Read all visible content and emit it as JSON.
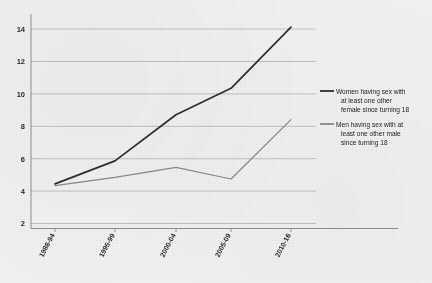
{
  "chart_data": {
    "type": "line",
    "title": "",
    "subtitle": "",
    "xlabel": "",
    "ylabel": "",
    "categories": [
      "1988-94",
      "1995-99",
      "2000-04",
      "2005-09",
      "2010-16"
    ],
    "series": [
      {
        "name": "Women having sex with at least one other female since turning 18",
        "short_name": "women",
        "values": [
          4.7,
          6.1,
          8.9,
          10.5,
          14.2
        ],
        "color": "#2e2e2e"
      },
      {
        "name": "Men having sex with at least one other male since turning 18",
        "short_name": "men",
        "values": [
          4.6,
          5.1,
          5.7,
          5.0,
          8.6
        ],
        "color": "#8a8a8a"
      }
    ],
    "ylim": [
      2,
      15
    ],
    "yticks": [
      2,
      4,
      6,
      8,
      10,
      12,
      14
    ],
    "ytick_labels": [
      "2",
      "4",
      "6",
      "8",
      "10",
      "12",
      "14"
    ],
    "grid": true,
    "grid_axis": "y",
    "legend_position": "right",
    "background_color": "#f1f1ef",
    "axis_color": "#8e8e8e",
    "grid_color": "#b9b9b9"
  },
  "legend": {
    "entries": [
      {
        "label_lines": [
          "Women having sex with",
          "at least one other",
          "female since turning 18"
        ],
        "color": "#2e2e2e"
      },
      {
        "label_lines": [
          "Men having sex with at",
          "least one other male",
          "since turning 18"
        ],
        "color": "#8a8a8a"
      }
    ]
  },
  "axes": {
    "y_tick_0": "2",
    "y_tick_1": "4",
    "y_tick_2": "6",
    "y_tick_3": "8",
    "y_tick_4": "10",
    "y_tick_5": "12",
    "y_tick_6": "14",
    "x_tick_0": "1988-94",
    "x_tick_1": "1995-99",
    "x_tick_2": "2000-04",
    "x_tick_3": "2005-09",
    "x_tick_4": "2010-16"
  }
}
